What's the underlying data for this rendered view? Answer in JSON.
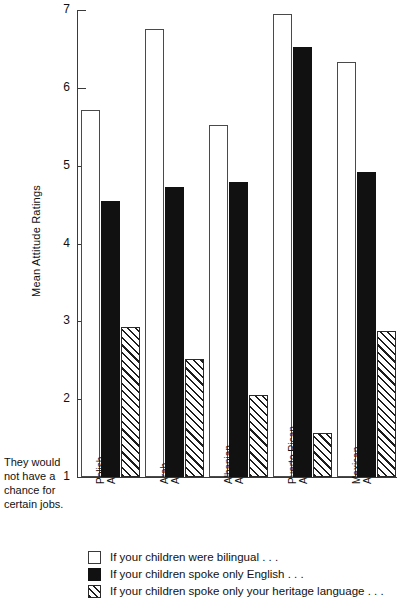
{
  "chart_data": {
    "type": "bar",
    "title": "",
    "xlabel": "",
    "ylabel": "Mean Attitude Ratings",
    "ylim": [
      1,
      7
    ],
    "yticks": [
      1,
      2,
      3,
      4,
      5,
      6,
      7
    ],
    "ytick_labels": [
      "1",
      "2",
      "3",
      "4",
      "5",
      "6",
      "7"
    ],
    "grid": false,
    "legend_position": "bottom",
    "baseline_note": "They would not have a chance for certain jobs.",
    "categories": [
      "Polish Americans",
      "Arab Americans",
      "Albanian Americans",
      "Puerto Rican Americans",
      "Mexican Americans"
    ],
    "category_lines": [
      [
        "Polish",
        "Americans"
      ],
      [
        "Arab",
        "Americans"
      ],
      [
        "Albanian",
        "Americans"
      ],
      [
        "Puerto Rican",
        "Americans"
      ],
      [
        "Mexican",
        "Americans"
      ]
    ],
    "series": [
      {
        "name": "If your children were bilingual . . .",
        "style": "open",
        "values": [
          5.72,
          6.75,
          5.52,
          6.95,
          6.33
        ]
      },
      {
        "name": "If your children spoke only English . . .",
        "style": "solid",
        "values": [
          4.55,
          4.72,
          4.79,
          6.52,
          4.92
        ]
      },
      {
        "name": "If your children spoke only your heritage language . . .",
        "style": "hatch",
        "values": [
          2.93,
          2.52,
          2.06,
          1.56,
          2.87
        ]
      }
    ],
    "colors": {
      "axis": "#3a3a3a",
      "open_fill": "#ffffff",
      "open_stroke": "#4a4a4a",
      "solid_fill": "#111111",
      "hatch_stroke": "#2a2a2a",
      "text": "#111111"
    }
  }
}
